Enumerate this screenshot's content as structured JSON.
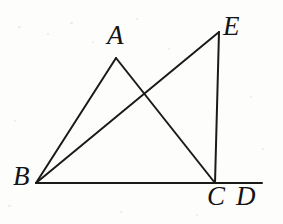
{
  "figure": {
    "background_color": "#fdfdfc",
    "stroke_color": "#1a1a1a",
    "stroke_width": 2,
    "labels": {
      "A": "A",
      "B": "B",
      "C": "C",
      "D": "D",
      "E": "E"
    },
    "points": {
      "A": {
        "x": 116,
        "y": 58
      },
      "B": {
        "x": 36,
        "y": 183
      },
      "C": {
        "x": 215,
        "y": 183
      },
      "D": {
        "x": 262,
        "y": 183
      },
      "E": {
        "x": 219,
        "y": 32
      },
      "intersection": {
        "x": 142,
        "y": 92
      }
    },
    "segments": [
      {
        "name": "BD",
        "from": "B",
        "to": "D",
        "description": "horizontal base line through C extended to D"
      },
      {
        "name": "BA",
        "from": "B",
        "to": "A",
        "description": "left side of triangle ABC"
      },
      {
        "name": "AC",
        "from": "A",
        "to": "C",
        "description": "right side of triangle ABC, crosses BE"
      },
      {
        "name": "BE",
        "from": "B",
        "to": "E",
        "description": "long diagonal from B up to E, crosses AC"
      },
      {
        "name": "EC",
        "from": "E",
        "to": "C",
        "description": "near-vertical right side from E down to C"
      }
    ]
  }
}
